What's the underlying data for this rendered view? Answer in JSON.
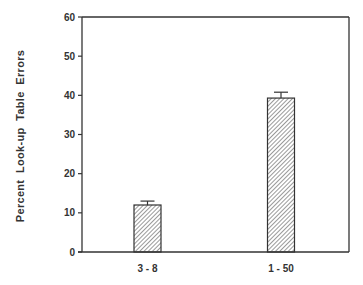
{
  "chart_data": {
    "type": "bar",
    "title": "",
    "xlabel": "",
    "ylabel": "Percent  Look-up  Table  Errors",
    "categories": [
      "3-8",
      "1-50"
    ],
    "values": [
      12,
      39.3
    ],
    "error_bars": [
      1,
      1.5
    ],
    "ylim": [
      0,
      60
    ],
    "yticks": [
      0,
      10,
      20,
      30,
      40,
      50,
      60
    ],
    "grid": false,
    "legend": null,
    "bar_fill": "diagonal-hatch",
    "colors": {
      "axis": "#333333",
      "hatch": "#555555",
      "background": "#ffffff"
    }
  }
}
